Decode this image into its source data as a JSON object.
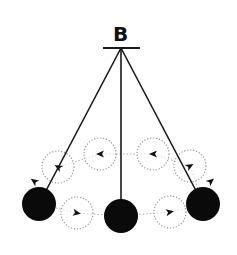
{
  "diagram": {
    "pivot_label": "B",
    "colors": {
      "ball": "#0a0a0a",
      "string": "#1a1a1a",
      "ghost": "#9a9a9a",
      "arrow": "#111111"
    },
    "pivot": {
      "x": 121,
      "y": 48
    },
    "pendulum_positions": [
      {
        "name": "left",
        "x": 39,
        "y": 204
      },
      {
        "name": "center",
        "x": 121,
        "y": 216
      },
      {
        "name": "right",
        "x": 203,
        "y": 204
      }
    ],
    "ghost_positions": [
      {
        "name": "upper-left",
        "x": 58,
        "y": 167,
        "arrow_angle": 210
      },
      {
        "name": "top-left",
        "x": 100,
        "y": 154,
        "arrow_angle": 180
      },
      {
        "name": "top-right",
        "x": 153,
        "y": 154,
        "arrow_angle": 180
      },
      {
        "name": "upper-right",
        "x": 190,
        "y": 166,
        "arrow_angle": -30
      },
      {
        "name": "bottom-left",
        "x": 77,
        "y": 213,
        "arrow_angle": 10
      },
      {
        "name": "bottom-right",
        "x": 170,
        "y": 212,
        "arrow_angle": -10
      }
    ],
    "extra_arrows": [
      {
        "name": "left-outer-arrow",
        "x": 34,
        "y": 181,
        "angle": 215
      },
      {
        "name": "right-outer-arrow",
        "x": 211,
        "y": 181,
        "angle": -40
      }
    ]
  }
}
